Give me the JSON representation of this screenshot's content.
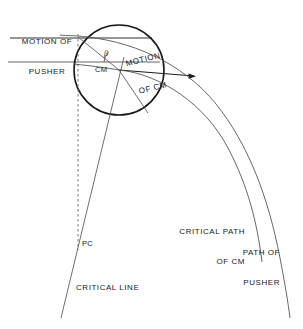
{
  "figure": {
    "type": "technical-line-diagram",
    "background_color": "#ffffff",
    "line_color": "#1a1a1a",
    "width": 303,
    "height": 329
  },
  "labels": {
    "motion_of_pusher_line1": "MOTION OF",
    "motion_of_pusher_line2": "PUSHER",
    "motion_of_cm_line1": "MOTION",
    "motion_of_cm_line2": "OF CM",
    "beta": "β",
    "cm": "CM",
    "pc": "PC",
    "critical_line": "CRITICAL LINE",
    "critical_path_of_cm_line1": "CRITICAL PATH",
    "critical_path_of_cm_line2": "OF CM",
    "path_of_pusher_line1": "PATH OF",
    "path_of_pusher_line2": "PUSHER"
  },
  "geometry": {
    "disk": {
      "cx": 119,
      "cy": 70,
      "r": 45
    },
    "contact_point": {
      "x": 78,
      "y": 36
    },
    "cm_point": {
      "x": 119,
      "y": 70
    },
    "pc_point": {
      "x": 78,
      "y": 244
    },
    "velocity_arrow_tip": {
      "x": 196,
      "y": 76
    },
    "pusher_motion_line_y": 38,
    "cm_motion_line_y": 62,
    "critical_line_angle_deg": 105,
    "dashed_line_x": 78
  }
}
